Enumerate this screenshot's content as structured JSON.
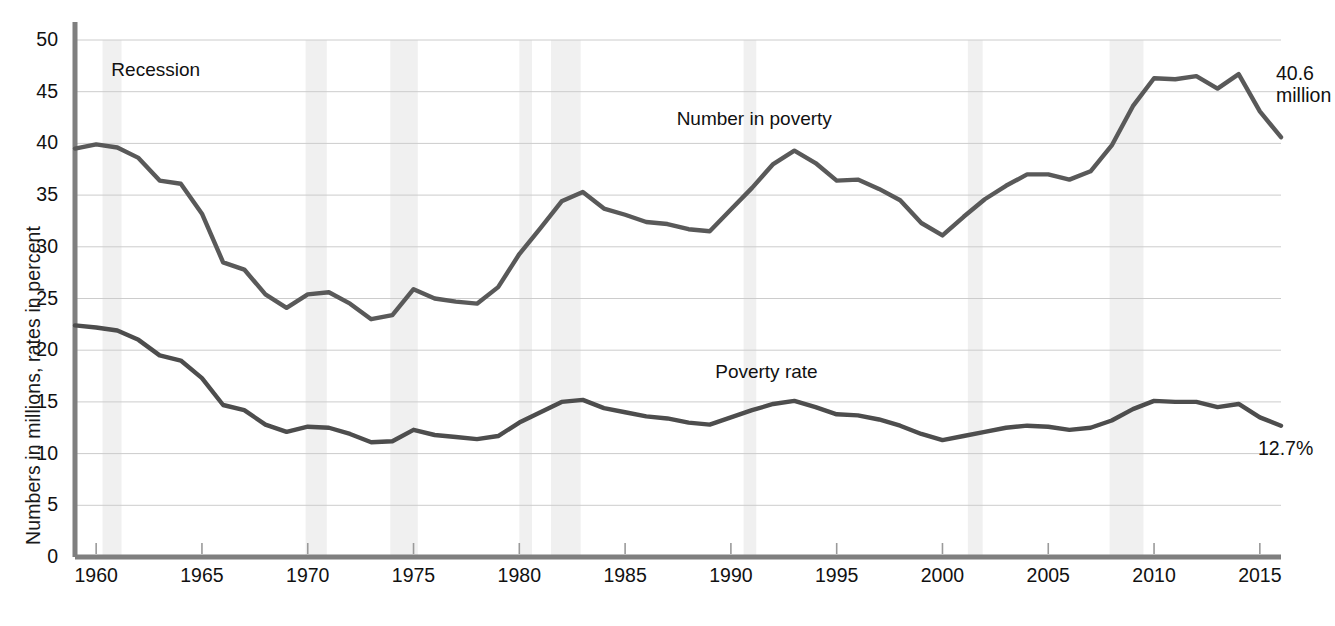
{
  "chart_data": {
    "type": "line",
    "title": "",
    "xlabel": "",
    "ylabel": "Numbers in millions, rates in percent",
    "xlim": [
      1959,
      2016
    ],
    "ylim": [
      0,
      50
    ],
    "grid": true,
    "legend": "inline-annotations",
    "x_ticks": [
      "1960",
      "1965",
      "1970",
      "1975",
      "1980",
      "1985",
      "1990",
      "1995",
      "2000",
      "2005",
      "2010",
      "2015"
    ],
    "x_tick_values": [
      1960,
      1965,
      1970,
      1975,
      1980,
      1985,
      1990,
      1995,
      2000,
      2005,
      2010,
      2015
    ],
    "y_ticks": [
      "0",
      "5",
      "10",
      "15",
      "20",
      "25",
      "30",
      "35",
      "40",
      "45",
      "50"
    ],
    "y_tick_values": [
      0,
      5,
      10,
      15,
      20,
      25,
      30,
      35,
      40,
      45,
      50
    ],
    "x": [
      1959,
      1960,
      1961,
      1962,
      1963,
      1964,
      1965,
      1966,
      1967,
      1968,
      1969,
      1970,
      1971,
      1972,
      1973,
      1974,
      1975,
      1976,
      1977,
      1978,
      1979,
      1980,
      1981,
      1982,
      1983,
      1984,
      1985,
      1986,
      1987,
      1988,
      1989,
      1990,
      1991,
      1992,
      1993,
      1994,
      1995,
      1996,
      1997,
      1998,
      1999,
      2000,
      2001,
      2002,
      2003,
      2004,
      2005,
      2006,
      2007,
      2008,
      2009,
      2010,
      2011,
      2012,
      2013,
      2014,
      2015,
      2016
    ],
    "series": [
      {
        "name": "Number in poverty",
        "unit": "millions",
        "color": "#595959",
        "end_label": "40.6 million",
        "values": [
          39.5,
          39.9,
          39.6,
          38.6,
          36.4,
          36.1,
          33.2,
          28.5,
          27.8,
          25.4,
          24.1,
          25.4,
          25.6,
          24.5,
          23.0,
          23.4,
          25.9,
          25.0,
          24.7,
          24.5,
          26.1,
          29.3,
          31.8,
          34.4,
          35.3,
          33.7,
          33.1,
          32.4,
          32.2,
          31.7,
          31.5,
          33.6,
          35.7,
          38.0,
          39.3,
          38.1,
          36.4,
          36.5,
          35.6,
          34.5,
          32.3,
          31.1,
          32.9,
          34.6,
          35.9,
          37.0,
          37.0,
          36.5,
          37.3,
          39.8,
          43.6,
          46.3,
          46.2,
          46.5,
          45.3,
          46.7,
          43.1,
          40.6
        ]
      },
      {
        "name": "Poverty rate",
        "unit": "percent",
        "color": "#4d4d4d",
        "end_label": "12.7%",
        "values": [
          22.4,
          22.2,
          21.9,
          21.0,
          19.5,
          19.0,
          17.3,
          14.7,
          14.2,
          12.8,
          12.1,
          12.6,
          12.5,
          11.9,
          11.1,
          11.2,
          12.3,
          11.8,
          11.6,
          11.4,
          11.7,
          13.0,
          14.0,
          15.0,
          15.2,
          14.4,
          14.0,
          13.6,
          13.4,
          13.0,
          12.8,
          13.5,
          14.2,
          14.8,
          15.1,
          14.5,
          13.8,
          13.7,
          13.3,
          12.7,
          11.9,
          11.3,
          11.7,
          12.1,
          12.5,
          12.7,
          12.6,
          12.3,
          12.5,
          13.2,
          14.3,
          15.1,
          15.0,
          15.0,
          14.5,
          14.8,
          13.5,
          12.7
        ]
      }
    ],
    "annotations": [
      {
        "text": "Recession",
        "x": 1964.5,
        "y": 47.0,
        "role": "shading-legend"
      },
      {
        "text": "Number in poverty",
        "x": 1991.5,
        "y": 42.3,
        "role": "series-label"
      },
      {
        "text": "Poverty rate",
        "x": 1992.0,
        "y": 17.8,
        "role": "series-label"
      }
    ],
    "recession_bands": [
      {
        "start": 1960.3,
        "end": 1961.2
      },
      {
        "start": 1969.9,
        "end": 1970.9
      },
      {
        "start": 1973.9,
        "end": 1975.2
      },
      {
        "start": 1980.0,
        "end": 1980.6
      },
      {
        "start": 1981.5,
        "end": 1982.9
      },
      {
        "start": 1990.6,
        "end": 1991.2
      },
      {
        "start": 2001.2,
        "end": 2001.9
      },
      {
        "start": 2007.9,
        "end": 2009.5
      }
    ],
    "recession_band_color": "#f0f0f0",
    "grid_color": "#cccccc",
    "axis_color": "#7f7f7f",
    "background": "#ffffff"
  }
}
